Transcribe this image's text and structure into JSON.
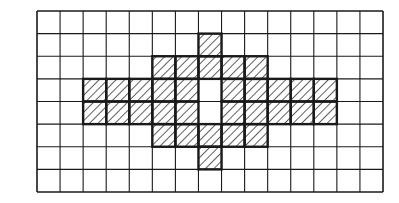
{
  "figure": {
    "type": "grid-shading-diagram",
    "grid": {
      "columns": 15,
      "rows": 8
    },
    "colors": {
      "line": "#1a1a1a",
      "background": "#ffffff",
      "hatch": "#1a1a1a"
    },
    "fill_style": "diagonal-hatch",
    "shaded_cells": [
      [
        1,
        7
      ],
      [
        2,
        5
      ],
      [
        2,
        6
      ],
      [
        2,
        7
      ],
      [
        2,
        8
      ],
      [
        2,
        9
      ],
      [
        3,
        2
      ],
      [
        3,
        3
      ],
      [
        3,
        4
      ],
      [
        3,
        5
      ],
      [
        3,
        6
      ],
      [
        3,
        8
      ],
      [
        3,
        9
      ],
      [
        3,
        10
      ],
      [
        3,
        11
      ],
      [
        3,
        12
      ],
      [
        4,
        2
      ],
      [
        4,
        3
      ],
      [
        4,
        4
      ],
      [
        4,
        5
      ],
      [
        4,
        6
      ],
      [
        4,
        8
      ],
      [
        4,
        9
      ],
      [
        4,
        10
      ],
      [
        4,
        11
      ],
      [
        4,
        12
      ],
      [
        5,
        5
      ],
      [
        5,
        6
      ],
      [
        5,
        7
      ],
      [
        5,
        8
      ],
      [
        5,
        9
      ],
      [
        6,
        7
      ]
    ],
    "shaded_count": 32
  }
}
